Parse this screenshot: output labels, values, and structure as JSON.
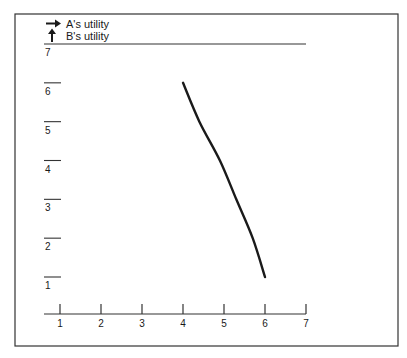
{
  "chart_data": {
    "type": "line",
    "title": "",
    "xlabel": "A's utility",
    "ylabel": "B's utility",
    "legend": [
      {
        "icon": "arrow-right-icon",
        "label": "A's utility"
      },
      {
        "icon": "arrow-up-icon",
        "label": "B's utility"
      }
    ],
    "x_ticks": [
      "1",
      "2",
      "3",
      "4",
      "5",
      "6",
      "7"
    ],
    "y_ticks": [
      "1",
      "2",
      "3",
      "4",
      "5",
      "6",
      "7"
    ],
    "xlim": [
      1,
      7
    ],
    "ylim": [
      1,
      7
    ],
    "grid": false,
    "legend_position": "top-left",
    "series": [
      {
        "name": "utility frontier",
        "color": "#1a1a1a",
        "points": [
          {
            "x": 4.0,
            "y": 6.0
          },
          {
            "x": 4.4,
            "y": 5.0
          },
          {
            "x": 4.9,
            "y": 4.0
          },
          {
            "x": 5.3,
            "y": 3.0
          },
          {
            "x": 5.7,
            "y": 2.0
          },
          {
            "x": 6.0,
            "y": 1.0
          }
        ]
      }
    ]
  },
  "colors": {
    "ink": "#1a1a1a",
    "frame": "#333333",
    "background": "#ffffff"
  }
}
